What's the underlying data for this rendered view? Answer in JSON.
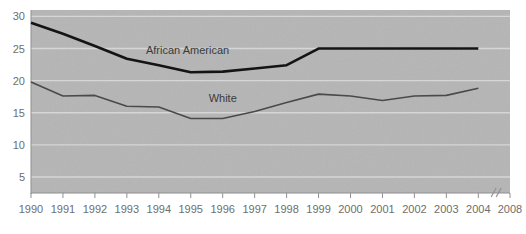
{
  "chart_data": {
    "type": "line",
    "title": "",
    "xlabel": "",
    "ylabel": "",
    "x": [
      1990,
      1991,
      1992,
      1993,
      1994,
      1995,
      1996,
      1997,
      1998,
      1999,
      2000,
      2001,
      2002,
      2003,
      2004
    ],
    "xtick_labels": [
      "1990",
      "1991",
      "1992",
      "1993",
      "1994",
      "1995",
      "1996",
      "1997",
      "1998",
      "1999",
      "2000",
      "2001",
      "2002",
      "2003",
      "2004",
      "2008"
    ],
    "axis_break": {
      "present": true,
      "symbol": "//",
      "between": [
        "2004",
        "2008"
      ]
    },
    "ytick_labels": [
      "30",
      "25",
      "20",
      "15",
      "10",
      "5"
    ],
    "ytick_values": [
      30,
      25,
      20,
      15,
      10,
      5
    ],
    "ylim": [
      2.5,
      31
    ],
    "grid": true,
    "legend_position": "inline-labels",
    "series": [
      {
        "name": "African American",
        "label": "African American",
        "color": "#141414",
        "line_width": 2.6,
        "values": [
          29.0,
          27.3,
          25.4,
          23.4,
          22.4,
          21.3,
          21.4,
          21.9,
          22.4,
          25.0,
          25.0,
          25.0,
          25.0,
          25.0,
          25.0
        ],
        "label_x": 1994.9,
        "label_y": 24.2
      },
      {
        "name": "White",
        "label": "White",
        "color": "#4a4a4a",
        "line_width": 1.6,
        "values": [
          19.8,
          17.6,
          17.7,
          16.0,
          15.9,
          14.1,
          14.1,
          15.2,
          16.6,
          17.9,
          17.6,
          16.9,
          17.6,
          17.7,
          18.8
        ],
        "label_x": 1996.0,
        "label_y": 16.6
      }
    ],
    "colors": {
      "plot_background": "#b5b5b5",
      "page_background": "#ffffff",
      "gridline": "#dcdcdc",
      "axis": "#8f8f8f",
      "tick_text": "#6e6e6e",
      "series_primary": "#141414",
      "series_secondary": "#4a4a4a"
    }
  }
}
